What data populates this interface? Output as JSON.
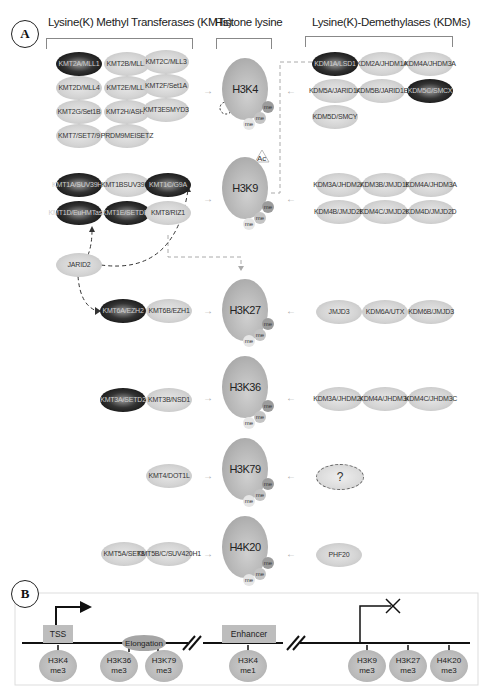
{
  "panel_a": {
    "label": "A",
    "titles": {
      "kmt": "Lysine(K) Methyl Transferases (KMTs)",
      "histone": "Histone lysine",
      "kdm": "Lysine(K)-Demethylases (KDMs)"
    },
    "rows": [
      {
        "histone": "H3K4",
        "kmts": [
          {
            "l1": "KMT2A/",
            "l2": "MLL1",
            "dark": true
          },
          {
            "l1": "KMT2B/",
            "l2": "MLL2",
            "dark": false
          },
          {
            "l1": "KMT2C/",
            "l2": "MLL3",
            "dark": false
          },
          {
            "l1": "KMT2D/",
            "l2": "MLL4",
            "dark": false
          },
          {
            "l1": "KMT2E/",
            "l2": "MLL5",
            "dark": false
          },
          {
            "l1": "KMT2F/",
            "l2": "Set1A",
            "dark": false
          },
          {
            "l1": "KMT2G/",
            "l2": "Set1B",
            "dark": false
          },
          {
            "l1": "KMT2H/",
            "l2": "ASH1",
            "dark": false
          },
          {
            "l1": "KMT3E",
            "l2": "SMYD3",
            "dark": false
          },
          {
            "l1": "KMT7/",
            "l2": "SET7/9",
            "dark": false
          },
          {
            "l1": "PRDM9",
            "l2": "MEISETZ",
            "dark": false
          }
        ],
        "kdms": [
          {
            "l1": "KDM1A/",
            "l2": "LSD1",
            "dark": true
          },
          {
            "l1": "KDM2A/",
            "l2": "JHDM1A",
            "dark": false
          },
          {
            "l1": "KDM4A/",
            "l2": "JHDM3A",
            "dark": false
          },
          {
            "l1": "KDM5A/",
            "l2": "JARID1A",
            "dark": false
          },
          {
            "l1": "KDM5B/",
            "l2": "JARID1B",
            "dark": false
          },
          {
            "l1": "KDM5C/",
            "l2": "SMCX",
            "dark": true
          },
          {
            "l1": "KDM5D/",
            "l2": "SMCY",
            "dark": false
          }
        ]
      },
      {
        "histone": "H3K9",
        "modifier": "Ac",
        "kmts": [
          {
            "l1": "KMT1A/",
            "l2": "SUV39H1",
            "dark": true
          },
          {
            "l1": "KMT1B",
            "l2": "SUV39H2",
            "dark": false
          },
          {
            "l1": "KMT1C/",
            "l2": "G9A",
            "dark": true
          },
          {
            "l1": "KMT1D/",
            "l2": "EuHMTase1",
            "dark": true
          },
          {
            "l1": "KMT1E/",
            "l2": "SETDB1",
            "dark": true
          },
          {
            "l1": "KMT8/RIZ1",
            "l2": "",
            "dark": false
          }
        ],
        "kdms": [
          {
            "l1": "KDM3A/",
            "l2": "JHDM2A",
            "dark": false
          },
          {
            "l1": "KDM3B/",
            "l2": "JMJD1B",
            "dark": false
          },
          {
            "l1": "KDM4A/",
            "l2": "JHDM3A",
            "dark": false
          },
          {
            "l1": "KDM4B/",
            "l2": "JMJD2B",
            "dark": false
          },
          {
            "l1": "KDM4C/",
            "l2": "JMJD2C",
            "dark": false
          },
          {
            "l1": "KDM4D/",
            "l2": "JMJD2D",
            "dark": false
          }
        ],
        "regulator": "JARID2"
      },
      {
        "histone": "H3K27",
        "kmts": [
          {
            "l1": "KMT6A/",
            "l2": "EZH2",
            "dark": true
          },
          {
            "l1": "KMT6B/",
            "l2": "EZH1",
            "dark": false
          }
        ],
        "kdms": [
          {
            "l1": "JMJD3",
            "l2": "",
            "dark": false
          },
          {
            "l1": "KDM6A/",
            "l2": "UTX",
            "dark": false
          },
          {
            "l1": "KDM6B/",
            "l2": "JMJD3",
            "dark": false
          }
        ]
      },
      {
        "histone": "H3K36",
        "kmts": [
          {
            "l1": "KMT3A/",
            "l2": "SETD2",
            "dark": true
          },
          {
            "l1": "KMT3B/",
            "l2": "NSD1",
            "dark": false
          }
        ],
        "kdms": [
          {
            "l1": "KDM3A/",
            "l2": "JHDM2A",
            "dark": false
          },
          {
            "l1": "KDM4A/",
            "l2": "JHDM3A",
            "dark": false
          },
          {
            "l1": "KDM4C/",
            "l2": "JHDM3C",
            "dark": false
          }
        ]
      },
      {
        "histone": "H3K79",
        "kmts": [
          {
            "l1": "KMT4/",
            "l2": "DOT1L",
            "dark": false
          }
        ],
        "kdms": [
          {
            "l1": "?",
            "l2": "",
            "dark": false,
            "unknown": true
          }
        ]
      },
      {
        "histone": "H4K20",
        "kmts": [
          {
            "l1": "KMT5A/",
            "l2": "SET8",
            "dark": false
          },
          {
            "l1": "KMT5B/C/",
            "l2": "SUV420H1",
            "dark": false
          }
        ],
        "kdms": [
          {
            "l1": "PHF20",
            "l2": "",
            "dark": false
          }
        ]
      }
    ],
    "me_label": "me"
  },
  "panel_b": {
    "label": "B",
    "elements": {
      "tss": "TSS",
      "elongation": "Elongation",
      "enhancer": "Enhancer"
    },
    "marks": [
      {
        "l1": "H3K4",
        "l2": "me3"
      },
      {
        "l1": "H3K36",
        "l2": "me3"
      },
      {
        "l1": "H3K79",
        "l2": "me3"
      },
      {
        "l1": "H3K4",
        "l2": "me1"
      },
      {
        "l1": "H3K9",
        "l2": "me3"
      },
      {
        "l1": "H3K27",
        "l2": "me3"
      },
      {
        "l1": "H4K20",
        "l2": "me3"
      }
    ]
  }
}
